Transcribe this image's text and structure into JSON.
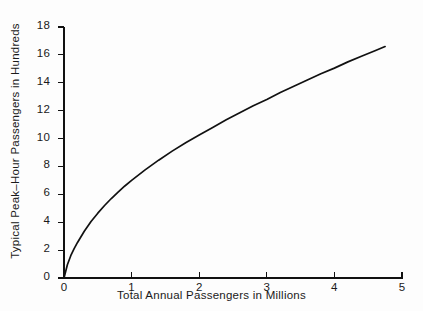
{
  "chart_data": {
    "type": "line",
    "title": "",
    "xlabel": "Total Annual Passengers in Millions",
    "ylabel": "Typical Peak–Hour Passengers in Hundreds",
    "xlim": [
      0,
      5
    ],
    "ylim": [
      0,
      18
    ],
    "xticks": [
      0,
      1,
      2,
      3,
      4,
      5
    ],
    "xtick_labels": [
      "0",
      "1",
      "2",
      "3",
      "4",
      "5"
    ],
    "yticks": [
      0,
      2,
      4,
      6,
      8,
      10,
      12,
      14,
      16,
      18
    ],
    "ytick_labels": [
      "0",
      "2",
      "4",
      "6",
      "8",
      "10",
      "12",
      "14",
      "16",
      "18"
    ],
    "grid": false,
    "legend": null,
    "series": [
      {
        "name": "Typical peak-hour passengers",
        "color": "#111111",
        "x": [
          0.0,
          0.05,
          0.1,
          0.15,
          0.2,
          0.3,
          0.4,
          0.5,
          0.6,
          0.7,
          0.8,
          0.9,
          1.0,
          1.2,
          1.4,
          1.6,
          1.8,
          2.0,
          2.2,
          2.4,
          2.6,
          2.8,
          3.0,
          3.2,
          3.4,
          3.6,
          3.8,
          4.0,
          4.2,
          4.4,
          4.6,
          4.75
        ],
        "y": [
          0.0,
          0.95,
          1.6,
          2.1,
          2.55,
          3.35,
          4.05,
          4.65,
          5.2,
          5.7,
          6.15,
          6.6,
          7.0,
          7.75,
          8.45,
          9.1,
          9.7,
          10.25,
          10.8,
          11.35,
          11.85,
          12.35,
          12.8,
          13.3,
          13.75,
          14.2,
          14.65,
          15.05,
          15.5,
          15.9,
          16.3,
          16.6
        ]
      }
    ]
  },
  "axes": {
    "x_axis_name": "x-axis",
    "y_axis_name": "y-axis"
  }
}
